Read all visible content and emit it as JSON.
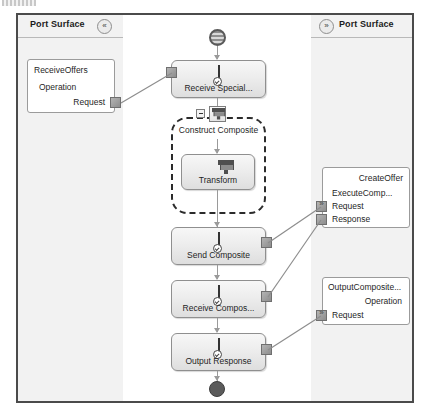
{
  "window": {
    "sliver_text": ""
  },
  "left_panel": {
    "title": "Port Surface",
    "collapse_icon": "chevron-double-left-icon",
    "collapse_glyph": "«",
    "ports": [
      {
        "name": "ReceiveOffers",
        "operation": "Operation",
        "messages": [
          "Request"
        ]
      }
    ]
  },
  "right_panel": {
    "title": "Port Surface",
    "expand_icon": "chevron-double-right-icon",
    "expand_glyph": "»",
    "ports": [
      {
        "name": "CreateOffer",
        "operation": "ExecuteComp...",
        "messages": [
          "Request",
          "Response"
        ]
      },
      {
        "name": "OutputComposite...",
        "operation": "Operation",
        "messages": [
          "Request"
        ]
      }
    ]
  },
  "orchestration": {
    "begin_node": "begin-shape",
    "end_node": "end-shape",
    "group": {
      "label": "Construct Composite",
      "icon": "transform-icon",
      "collapse_icon": "minus-icon"
    },
    "shapes": [
      {
        "label": "Receive Special...",
        "icon": "envelope-icon"
      },
      {
        "label": "Transform",
        "icon": "transform-icon"
      },
      {
        "label": "Send Composite",
        "icon": "envelope-icon"
      },
      {
        "label": "Receive Compos...",
        "icon": "envelope-icon"
      },
      {
        "label": "Output Response",
        "icon": "envelope-icon"
      }
    ]
  },
  "colors": {
    "frame_border": "#4b4b4b",
    "panel_bg": "#f2f2f2",
    "shape_border": "#8f8f8f",
    "connector": "#9a9a9a",
    "end_node": "#5b5b5b"
  }
}
